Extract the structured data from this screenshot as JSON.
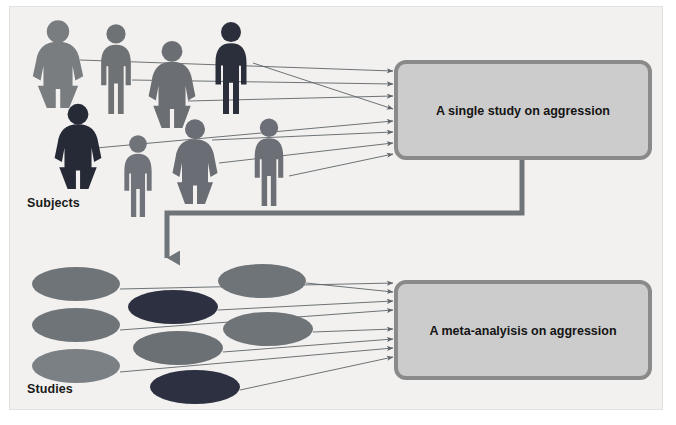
{
  "diagram": {
    "background_color": "#f2f1ef",
    "labels": {
      "subjects": "Subjects",
      "studies": "Studies"
    },
    "boxes": [
      {
        "id": "single-study",
        "text": "A single study on aggression",
        "fill": "#cccccc",
        "stroke": "#8a8a8a"
      },
      {
        "id": "meta-analysis",
        "text": "A meta-analyisis on aggression",
        "fill": "#cccccc",
        "stroke": "#8a8a8a"
      }
    ],
    "people": [
      {
        "id": "person-1",
        "type": "female",
        "color": "#7a7d80",
        "x": 30,
        "y": 22,
        "w": 56,
        "h": 86
      },
      {
        "id": "person-2",
        "type": "male",
        "color": "#6e7275",
        "x": 92,
        "y": 24,
        "w": 48,
        "h": 90
      },
      {
        "id": "person-3",
        "type": "female",
        "color": "#6b6e72",
        "x": 146,
        "y": 42,
        "w": 52,
        "h": 86
      },
      {
        "id": "person-4",
        "type": "male",
        "color": "#2b2f3c",
        "x": 206,
        "y": 22,
        "w": 50,
        "h": 92
      },
      {
        "id": "person-5",
        "type": "female",
        "color": "#262a36",
        "x": 52,
        "y": 105,
        "w": 52,
        "h": 84
      },
      {
        "id": "person-6",
        "type": "male",
        "color": "#70747a",
        "x": 116,
        "y": 135,
        "w": 44,
        "h": 82
      },
      {
        "id": "person-7",
        "type": "female",
        "color": "#6a6d73",
        "x": 170,
        "y": 120,
        "w": 50,
        "h": 84
      },
      {
        "id": "person-8",
        "type": "male",
        "color": "#6c7076",
        "x": 246,
        "y": 118,
        "w": 46,
        "h": 88
      }
    ],
    "studies": [
      {
        "id": "study-1",
        "cx": 76,
        "cy": 284,
        "rx": 44,
        "ry": 17,
        "color": "#6f7478"
      },
      {
        "id": "study-2",
        "cx": 262,
        "cy": 281,
        "rx": 44,
        "ry": 17,
        "color": "#6f7478"
      },
      {
        "id": "study-3",
        "cx": 173,
        "cy": 307,
        "rx": 45,
        "ry": 17,
        "color": "#2c3040"
      },
      {
        "id": "study-4",
        "cx": 76,
        "cy": 325,
        "rx": 44,
        "ry": 17,
        "color": "#6f7478"
      },
      {
        "id": "study-5",
        "cx": 268,
        "cy": 329,
        "rx": 45,
        "ry": 17,
        "color": "#6f7478"
      },
      {
        "id": "study-6",
        "cx": 178,
        "cy": 348,
        "rx": 45,
        "ry": 17,
        "color": "#6b7074"
      },
      {
        "id": "study-7",
        "cx": 76,
        "cy": 366,
        "rx": 44,
        "ry": 17,
        "color": "#7b8084"
      },
      {
        "id": "study-8",
        "cx": 195,
        "cy": 387,
        "rx": 45,
        "ry": 17,
        "color": "#2c3040"
      }
    ],
    "connector": {
      "id": "study-to-meta",
      "color": "#6f7478",
      "description": "Elbow arrow from bottom of single-study box down and left into the studies cluster"
    },
    "arrows_top": [
      {
        "from_x": 80,
        "from_y": 60,
        "to_x": 393,
        "to_y": 71
      },
      {
        "from_x": 132,
        "from_y": 80,
        "to_x": 393,
        "to_y": 84
      },
      {
        "from_x": 188,
        "from_y": 101,
        "to_x": 393,
        "to_y": 96
      },
      {
        "from_x": 253,
        "from_y": 63,
        "to_x": 393,
        "to_y": 109
      },
      {
        "from_x": 96,
        "from_y": 148,
        "to_x": 393,
        "to_y": 121
      },
      {
        "from_x": 212,
        "from_y": 140,
        "to_x": 393,
        "to_y": 132
      },
      {
        "from_x": 219,
        "from_y": 163,
        "to_x": 393,
        "to_y": 143
      },
      {
        "from_x": 289,
        "from_y": 176,
        "to_x": 393,
        "to_y": 154
      }
    ],
    "arrows_bottom": [
      {
        "from_x": 120,
        "from_y": 289,
        "to_x": 393,
        "to_y": 283
      },
      {
        "from_x": 306,
        "from_y": 283,
        "to_x": 393,
        "to_y": 292
      },
      {
        "from_x": 218,
        "from_y": 310,
        "to_x": 393,
        "to_y": 301
      },
      {
        "from_x": 120,
        "from_y": 330,
        "to_x": 393,
        "to_y": 310
      },
      {
        "from_x": 313,
        "from_y": 332,
        "to_x": 393,
        "to_y": 329
      },
      {
        "from_x": 223,
        "from_y": 352,
        "to_x": 393,
        "to_y": 339
      },
      {
        "from_x": 120,
        "from_y": 372,
        "to_x": 393,
        "to_y": 348
      },
      {
        "from_x": 240,
        "from_y": 390,
        "to_x": 393,
        "to_y": 357
      }
    ]
  }
}
